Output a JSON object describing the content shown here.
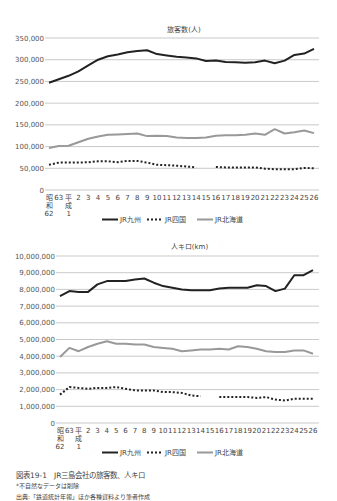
{
  "chart_data": [
    {
      "type": "line",
      "title": "旅客数(人)",
      "xlabel": "",
      "ylabel": "",
      "ylim": [
        0,
        350000
      ],
      "yticks": [
        "0",
        "50,000",
        "100,000",
        "150,000",
        "200,000",
        "250,000",
        "300,000",
        "350,000"
      ],
      "categories": [
        "昭和62",
        "63",
        "平成1",
        "2",
        "3",
        "4",
        "5",
        "6",
        "7",
        "8",
        "9",
        "10",
        "11",
        "12",
        "13",
        "14",
        "15",
        "16",
        "17",
        "18",
        "19",
        "20",
        "21",
        "22",
        "23",
        "24",
        "25",
        "26"
      ],
      "grid": true,
      "legend_position": "bottom",
      "series": [
        {
          "name": "JR九州",
          "style": "solid-black",
          "values": [
            247000,
            255000,
            263000,
            273000,
            287000,
            300000,
            308000,
            312000,
            317000,
            320000,
            322000,
            313000,
            310000,
            307000,
            305000,
            303000,
            297000,
            298000,
            295000,
            294000,
            293000,
            294000,
            298000,
            292000,
            298000,
            311000,
            314000,
            325000,
            320000
          ]
        },
        {
          "name": "JR四国",
          "style": "dotted-black",
          "values": [
            58000,
            63000,
            63000,
            63000,
            64000,
            66000,
            66000,
            64000,
            67000,
            67000,
            63000,
            58000,
            57000,
            56000,
            54000,
            52000,
            null,
            53000,
            52000,
            52000,
            52000,
            52000,
            49000,
            48000,
            48000,
            48000,
            51000,
            50000
          ]
        },
        {
          "name": "JR北海道",
          "style": "solid-gray",
          "values": [
            97000,
            101000,
            102000,
            110000,
            118000,
            123000,
            127000,
            128000,
            129000,
            130000,
            124000,
            125000,
            124000,
            121000,
            120000,
            120000,
            121000,
            125000,
            126000,
            126000,
            127000,
            130000,
            127000,
            140000,
            130000,
            133000,
            137000,
            131000
          ]
        }
      ]
    },
    {
      "type": "line",
      "title": "人キロ(km)",
      "xlabel": "",
      "ylabel": "",
      "ylim": [
        0,
        10000000
      ],
      "yticks": [
        "0",
        "1,000,000",
        "2,000,000",
        "3,000,000",
        "4,000,000",
        "5,000,000",
        "6,000,000",
        "7,000,000",
        "8,000,000",
        "9,000,000",
        "10,000,000"
      ],
      "categories": [
        "昭和62",
        "63",
        "平成1",
        "2",
        "3",
        "4",
        "5",
        "6",
        "7",
        "8",
        "9",
        "10",
        "11",
        "12",
        "13",
        "14",
        "15",
        "16",
        "17",
        "18",
        "19",
        "20",
        "21",
        "22",
        "23",
        "24",
        "25",
        "26"
      ],
      "grid": true,
      "legend_position": "bottom",
      "series": [
        {
          "name": "JR九州",
          "style": "solid-black",
          "values": [
            7600000,
            7900000,
            7850000,
            7850000,
            8300000,
            8500000,
            8500000,
            8500000,
            8600000,
            8650000,
            8400000,
            8200000,
            8100000,
            8000000,
            7950000,
            7950000,
            7950000,
            8050000,
            8100000,
            8100000,
            8100000,
            8250000,
            8200000,
            7900000,
            8050000,
            8850000,
            8850000,
            9150000,
            9100000
          ]
        },
        {
          "name": "JR四国",
          "style": "dotted-black",
          "values": [
            1700000,
            2150000,
            2100000,
            2050000,
            2100000,
            2100000,
            2150000,
            2050000,
            1950000,
            1950000,
            1950000,
            1850000,
            1850000,
            1800000,
            1650000,
            1600000,
            null,
            1550000,
            1550000,
            1550000,
            1550000,
            1500000,
            1550000,
            1400000,
            1350000,
            1450000,
            1450000,
            1450000
          ]
        },
        {
          "name": "JR北海道",
          "style": "solid-gray",
          "values": [
            3950000,
            4500000,
            4300000,
            4550000,
            4750000,
            4900000,
            4750000,
            4750000,
            4700000,
            4700000,
            4550000,
            4500000,
            4450000,
            4300000,
            4350000,
            4400000,
            4400000,
            4450000,
            4400000,
            4600000,
            4550000,
            4450000,
            4300000,
            4250000,
            4250000,
            4350000,
            4350000,
            4150000
          ]
        }
      ]
    }
  ],
  "xaxis_lines": {
    "line1": [
      "昭",
      "63",
      "平",
      "2",
      "3",
      "4",
      "5",
      "6",
      "7",
      "8",
      "9",
      "10",
      "11",
      "12",
      "13",
      "14",
      "15",
      "16",
      "17",
      "18",
      "19",
      "20",
      "21",
      "22",
      "23",
      "24",
      "25",
      "26"
    ],
    "line2": [
      "和",
      "",
      "成"
    ],
    "line3": [
      "62",
      "",
      "1"
    ]
  },
  "legend": [
    "JR九州",
    "JR四国",
    "JR北海道"
  ],
  "caption": {
    "title": "図表19-1　JR三島会社の旅客数、人キロ",
    "note": "*不自然なデータは削除",
    "source": "出典:「鉄道統計年報」ほか各種資料より筆者作成"
  }
}
